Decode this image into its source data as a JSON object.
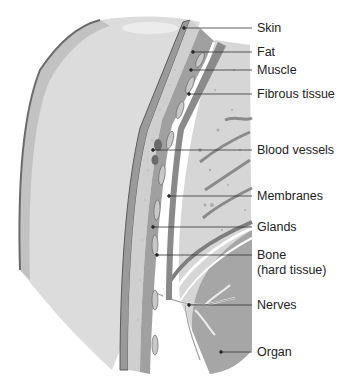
{
  "diagram": {
    "labels": [
      {
        "id": "skin",
        "text": "Skin",
        "y": 28,
        "tip": [
          184,
          28
        ]
      },
      {
        "id": "fat",
        "text": "Fat",
        "y": 52,
        "tip": [
          193,
          52
        ]
      },
      {
        "id": "muscle",
        "text": "Muscle",
        "y": 70,
        "tip": [
          191,
          70
        ]
      },
      {
        "id": "fibrous-tissue",
        "text": "Fibrous tissue",
        "y": 94,
        "tip": [
          189,
          94
        ]
      },
      {
        "id": "blood-vessels",
        "text": "Blood vessels",
        "y": 150,
        "tip": [
          153,
          150
        ]
      },
      {
        "id": "membranes",
        "text": "Membranes",
        "y": 196,
        "tip": [
          169,
          196
        ]
      },
      {
        "id": "glands",
        "text": "Glands",
        "y": 227,
        "tip": [
          153,
          227
        ]
      },
      {
        "id": "bone",
        "text": "Bone",
        "text2": "(hard tissue)",
        "y": 255,
        "tip": [
          157,
          255
        ]
      },
      {
        "id": "nerves",
        "text": "Nerves",
        "y": 305,
        "tip": [
          189,
          305
        ]
      },
      {
        "id": "organ",
        "text": "Organ",
        "y": 352,
        "tip": [
          221,
          352
        ]
      }
    ],
    "colors": {
      "outer_light": "#d8d8d8",
      "outer_mid": "#c4c4c4",
      "skin_line": "#6e6e6e",
      "fat_fill": "#cfcfcf",
      "muscle_fill": "#9a9a9a",
      "inner_cavity": "#dcdcdc",
      "organ_fill": "#a8a8a8",
      "bone_white": "#ffffff",
      "leader": "#333333"
    }
  }
}
